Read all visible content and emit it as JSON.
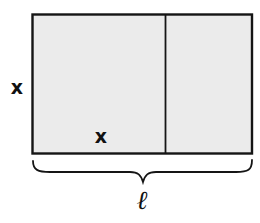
{
  "diagram": {
    "type": "rectangle-with-square-subdivision",
    "colors": {
      "fill": "#ebebeb",
      "stroke": "#151515",
      "background": "#ffffff"
    },
    "labels": {
      "height": "x",
      "square_side": "x",
      "length": "ℓ"
    },
    "parts": [
      {
        "name": "square",
        "description": "x by x square region"
      },
      {
        "name": "remainder",
        "description": "remaining rectangle of width ℓ − x"
      }
    ]
  }
}
